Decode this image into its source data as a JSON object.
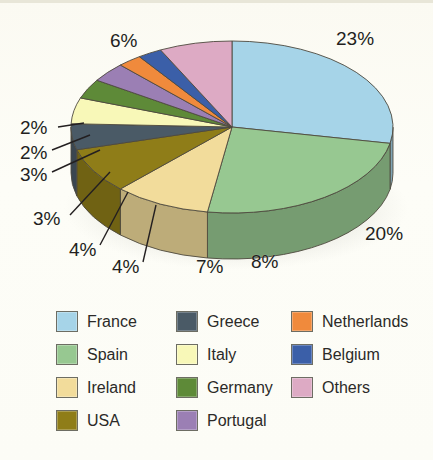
{
  "chart_data": {
    "type": "pie",
    "title": "",
    "subtitle": "",
    "xlabel": "",
    "ylabel": "",
    "grid": false,
    "legend_position": "bottom",
    "units": "percent",
    "start_angle_deg": 0,
    "direction": "clockwise",
    "three_d": true,
    "categories": [
      "France",
      "Spain",
      "Ireland",
      "USA",
      "Greece",
      "Italy",
      "Germany",
      "Portugal",
      "Netherlands",
      "Belgium",
      "Others"
    ],
    "values": [
      23,
      20,
      8,
      7,
      4,
      4,
      3,
      3,
      2,
      2,
      6
    ],
    "labels": [
      "23%",
      "20%",
      "8%",
      "7%",
      "4%",
      "4%",
      "3%",
      "3%",
      "2%",
      "2%",
      "6%"
    ],
    "colors": [
      "#a6d4e8",
      "#97c891",
      "#f2dc9b",
      "#8f7d18",
      "#4a5a66",
      "#f8f8b8",
      "#5e8a38",
      "#9b7fb4",
      "#f08a3c",
      "#3b5fa8",
      "#ddaac4"
    ],
    "slices": [
      {
        "name": "France",
        "value": 23,
        "label": "23%",
        "color": "#a6d4e8"
      },
      {
        "name": "Spain",
        "value": 20,
        "label": "20%",
        "color": "#97c891"
      },
      {
        "name": "Ireland",
        "value": 8,
        "label": "8%",
        "color": "#f2dc9b"
      },
      {
        "name": "USA",
        "value": 7,
        "label": "7%",
        "color": "#8f7d18"
      },
      {
        "name": "Greece",
        "value": 4,
        "label": "4%",
        "color": "#4a5a66"
      },
      {
        "name": "Italy",
        "value": 4,
        "label": "4%",
        "color": "#f8f8b8"
      },
      {
        "name": "Germany",
        "value": 3,
        "label": "3%",
        "color": "#5e8a38"
      },
      {
        "name": "Portugal",
        "value": 3,
        "label": "3%",
        "color": "#9b7fb4"
      },
      {
        "name": "Netherlands",
        "value": 2,
        "label": "2%",
        "color": "#f08a3c"
      },
      {
        "name": "Belgium",
        "value": 2,
        "label": "2%",
        "color": "#3b5fa8"
      },
      {
        "name": "Others",
        "value": 6,
        "label": "6%",
        "color": "#ddaac4"
      }
    ]
  },
  "value_labels": {
    "france": "23%",
    "spain": "20%",
    "ireland": "8%",
    "usa": "7%",
    "greece": "4%",
    "italy": "4%",
    "germany": "3%",
    "portugal": "3%",
    "netherlands": "2%",
    "belgium": "2%",
    "others": "6%"
  },
  "legend": {
    "columns": [
      {
        "items": [
          {
            "label": "France",
            "color": "#a6d4e8"
          },
          {
            "label": "Spain",
            "color": "#97c891"
          },
          {
            "label": "Ireland",
            "color": "#f2dc9b"
          },
          {
            "label": "USA",
            "color": "#8f7d18"
          }
        ]
      },
      {
        "items": [
          {
            "label": "Greece",
            "color": "#4a5a66"
          },
          {
            "label": "Italy",
            "color": "#f8f8b8"
          },
          {
            "label": "Germany",
            "color": "#5e8a38"
          },
          {
            "label": "Portugal",
            "color": "#9b7fb4"
          }
        ]
      },
      {
        "items": [
          {
            "label": "Netherlands",
            "color": "#f08a3c"
          },
          {
            "label": "Belgium",
            "color": "#3b5fa8"
          },
          {
            "label": "Others",
            "color": "#ddaac4"
          }
        ]
      }
    ]
  }
}
